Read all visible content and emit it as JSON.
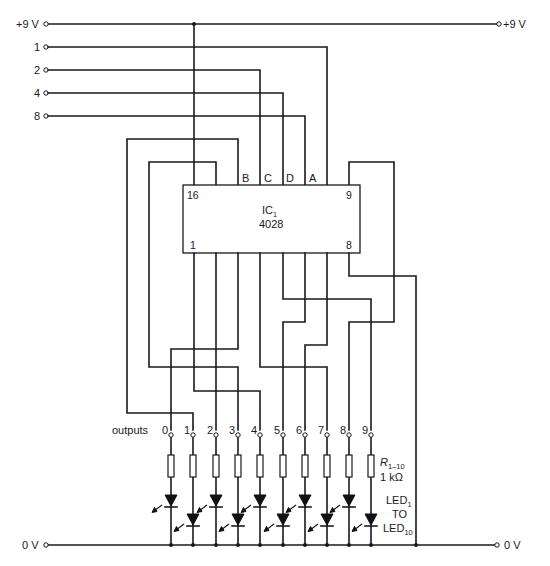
{
  "diagram": {
    "supply": {
      "left_label": "+9 V",
      "right_label": "+9 V",
      "y": 24,
      "x_start": 48,
      "x_end": 499,
      "junction_x": 194
    },
    "ground": {
      "left_label": "0 V",
      "right_label": "0 V",
      "y": 545,
      "x_start": 48,
      "x_end": 497
    },
    "inputs": [
      {
        "label": "1",
        "y": 47,
        "to_x": 327,
        "pin": "A"
      },
      {
        "label": "2",
        "y": 70,
        "to_x": 260,
        "pin": "B"
      },
      {
        "label": "4",
        "y": 93,
        "to_x": 283,
        "pin": "C"
      },
      {
        "label": "8",
        "y": 116,
        "to_x": 305,
        "pin": "D"
      }
    ],
    "ic": {
      "name": "IC",
      "subscript": "1",
      "part": "4028",
      "x": 183,
      "y": 185,
      "w": 177,
      "h": 68,
      "pin_labels": {
        "top_left": "16",
        "top_right": "9",
        "bottom_left": "1",
        "bottom_right": "8"
      },
      "input_pin_labels": [
        {
          "label": "B",
          "x": 245
        },
        {
          "label": "C",
          "x": 268
        },
        {
          "label": "D",
          "x": 290
        },
        {
          "label": "A",
          "x": 313
        }
      ]
    },
    "outputs_label": "outputs",
    "outputs": [
      {
        "label": "0",
        "x": 171,
        "led_row": "upper"
      },
      {
        "label": "1",
        "x": 193,
        "led_row": "lower"
      },
      {
        "label": "2",
        "x": 216,
        "led_row": "upper"
      },
      {
        "label": "3",
        "x": 238,
        "led_row": "lower"
      },
      {
        "label": "4",
        "x": 260,
        "led_row": "upper"
      },
      {
        "label": "5",
        "x": 283,
        "led_row": "lower"
      },
      {
        "label": "6",
        "x": 305,
        "led_row": "upper"
      },
      {
        "label": "7",
        "x": 327,
        "led_row": "lower"
      },
      {
        "label": "8",
        "x": 349,
        "led_row": "upper"
      },
      {
        "label": "9",
        "x": 371,
        "led_row": "lower"
      }
    ],
    "resistor_label": {
      "name": "R",
      "subscript": "1–10",
      "value": "1 kΩ"
    },
    "led_label": {
      "line1": "LED",
      "sub1": "1",
      "line2": "TO",
      "line3": "LED",
      "sub3": "10"
    },
    "colors": {
      "ink": "#1a1a1a",
      "paper": "#ffffff"
    }
  }
}
